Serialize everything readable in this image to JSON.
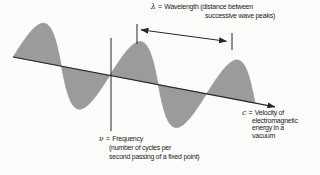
{
  "figure": {
    "background": "#fcfcfb",
    "ink_color": "#262626",
    "wave": {
      "fill": "#9b9b9b",
      "cycles": 2.5
    },
    "labels": {
      "wavelength": {
        "symbol": "λ",
        "equals": "=",
        "line1": "Wavelength (distance between",
        "line2": "successive wave peaks)"
      },
      "frequency": {
        "symbol": "ν",
        "equals": "=",
        "line1": "Frequency",
        "line2": "(number of cycles per",
        "line3": "second passing of a fixed point)"
      },
      "velocity": {
        "symbol": "c",
        "equals": "=",
        "line1": "Velocity of",
        "line2": "electromagnetic",
        "line3": "energy in a",
        "line4": "vacuum"
      }
    }
  }
}
